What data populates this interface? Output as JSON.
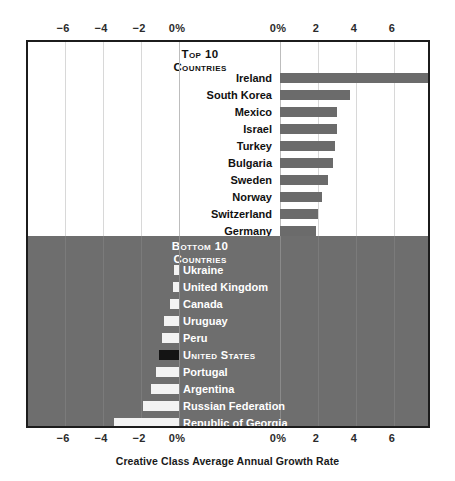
{
  "chart_data": {
    "type": "bar",
    "title": "",
    "xlabel": "Creative Class Average Annual Growth Rate",
    "ylabel": "",
    "grid": true,
    "orientation": "horizontal",
    "panels": [
      {
        "id": "top",
        "heading_line1": "Top 10",
        "heading_line2": "Countries",
        "axis_range": [
          0,
          7.9
        ],
        "axis_ticks": [
          "0%",
          "2",
          "4",
          "6"
        ],
        "axis_tick_values": [
          0,
          2,
          4,
          6
        ],
        "categories": [
          "Ireland",
          "South Korea",
          "Mexico",
          "Israel",
          "Turkey",
          "Bulgaria",
          "Sweden",
          "Norway",
          "Switzerland",
          "Germany"
        ],
        "values": [
          7.9,
          3.7,
          3.0,
          3.0,
          2.9,
          2.8,
          2.5,
          2.2,
          2.0,
          1.9
        ]
      },
      {
        "id": "bottom",
        "heading_line1": "Bottom 10",
        "heading_line2": "Countries",
        "axis_range": [
          -7.9,
          0
        ],
        "axis_ticks": [
          "-6",
          "-4",
          "-2",
          "0%"
        ],
        "axis_tick_values": [
          -6,
          -4,
          -2,
          0
        ],
        "categories": [
          "Ukraine",
          "United Kingdom",
          "Canada",
          "Uruguay",
          "Peru",
          "United States",
          "Portugal",
          "Argentina",
          "Russian Federation",
          "Republic of Georgia"
        ],
        "values": [
          -0.25,
          -0.3,
          -0.5,
          -0.8,
          -0.9,
          -1.05,
          -1.2,
          -1.5,
          -1.9,
          -3.4
        ],
        "highlight": "United States"
      }
    ],
    "xlim_left": [
      -7.9,
      0
    ],
    "xlim_right": [
      0,
      7.9
    ],
    "colors": {
      "positive_bar": "#6b6b6b",
      "negative_bar": "#f3f3f3",
      "highlight_bar": "#141414",
      "bottom_panel_bg": "#6e6e6e",
      "top_panel_bg": "#ffffff",
      "frame": "#1c1c1c",
      "gridline": "#d8d8d8"
    }
  },
  "axis_top": {
    "left_ticks": [
      "-6",
      "-4",
      "-2",
      "0%"
    ],
    "right_ticks": [
      "0%",
      "2",
      "4",
      "6"
    ]
  },
  "axis_bottom": {
    "left_ticks": [
      "-6",
      "-4",
      "-2",
      "0%"
    ],
    "right_ticks": [
      "0%",
      "2",
      "4",
      "6"
    ]
  },
  "caption": {
    "text": "Creative Class Average Annual Growth Rate"
  }
}
